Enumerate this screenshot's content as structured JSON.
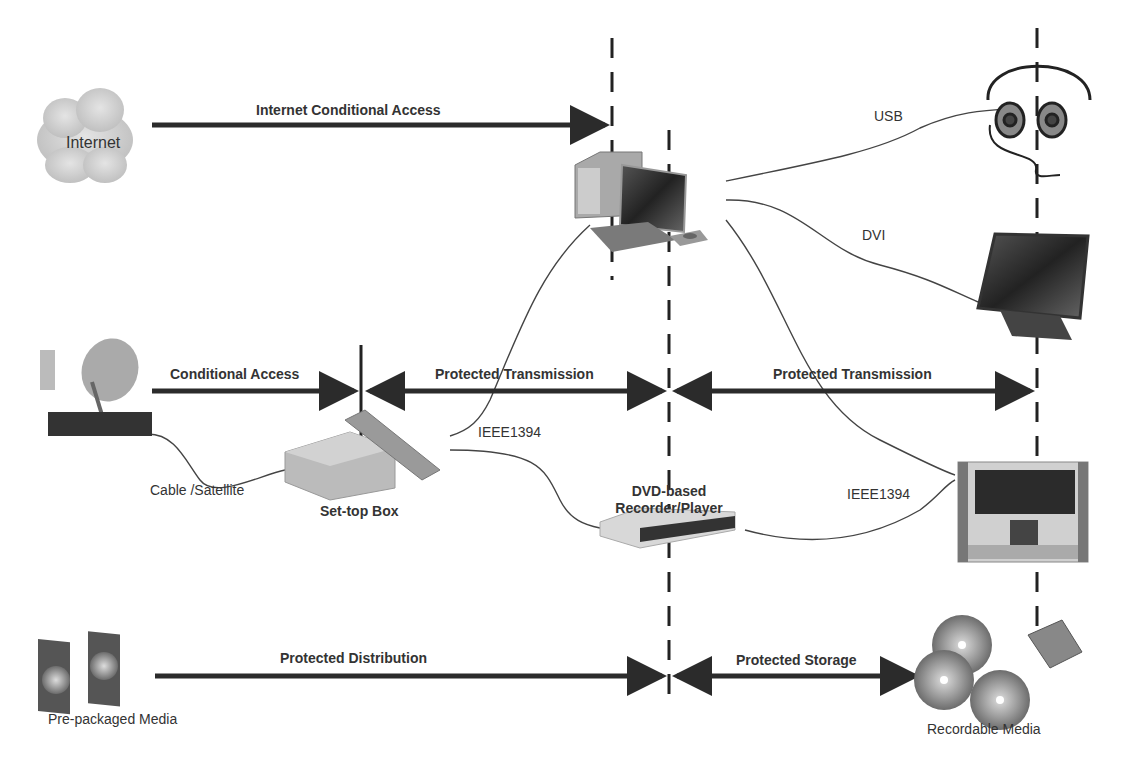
{
  "nodes": {
    "internet": "Internet",
    "set_top_box": "Set-top Box",
    "dvd_line1": "DVD-based",
    "dvd_line2": "Recorder/Player",
    "pre_packaged": "Pre-packaged Media",
    "recordable": "Recordable Media"
  },
  "arrows": {
    "internet_ca": "Internet Conditional Access",
    "ca": "Conditional Access",
    "pt1": "Protected Transmission",
    "pt2": "Protected Transmission",
    "pd": "Protected Distribution",
    "ps": "Protected Storage"
  },
  "connections": {
    "usb": "USB",
    "dvi": "DVI",
    "ieee1": "IEEE1394",
    "ieee2": "IEEE1394",
    "cable": "Cable /Satellite"
  },
  "colors": {
    "arrow": "#2b2b2b",
    "device": "#8a8a8a",
    "text": "#333333"
  }
}
